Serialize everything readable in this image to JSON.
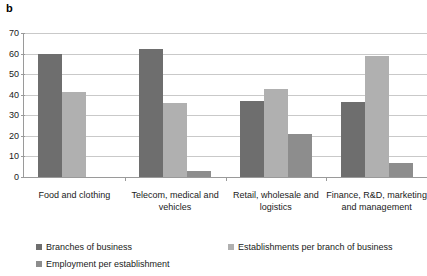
{
  "panel": {
    "label": "b"
  },
  "colors": {
    "series1": "#6e6e6e",
    "series2": "#b0b0b0",
    "series3": "#8d8d8d",
    "gridline": "#c9c9c9",
    "axis": "#9a9a9a",
    "text": "#1a1a1a",
    "background": "#ffffff"
  },
  "chart_data": {
    "type": "bar",
    "title": "",
    "xlabel": "",
    "ylabel": "",
    "ylim": [
      0,
      70
    ],
    "yticks": [
      0,
      10,
      20,
      30,
      40,
      50,
      60,
      70
    ],
    "ytick_labels": [
      "0",
      "10",
      "20",
      "30",
      "40",
      "50",
      "60",
      "70"
    ],
    "grid": true,
    "legend_position": "bottom",
    "categories": [
      "Food and clothing",
      "Telecom, medical and vehicles",
      "Retail, wholesale and logistics",
      "Finance, R&D, marketing and management"
    ],
    "series": [
      {
        "name": "Branches of business",
        "color": "#6e6e6e",
        "values": [
          60,
          62,
          37,
          36.5
        ]
      },
      {
        "name": "Establishments per branch of business",
        "color": "#b0b0b0",
        "values": [
          41.5,
          36,
          43,
          59
        ]
      },
      {
        "name": "Employment per establishment",
        "color": "#8d8d8d",
        "values": [
          0,
          3,
          21,
          7
        ]
      }
    ]
  },
  "legend": [
    {
      "label": "Branches of business",
      "color": "#6e6e6e"
    },
    {
      "label": "Establishments per branch of business",
      "color": "#b0b0b0"
    },
    {
      "label": "Employment per establishment",
      "color": "#8d8d8d"
    }
  ]
}
